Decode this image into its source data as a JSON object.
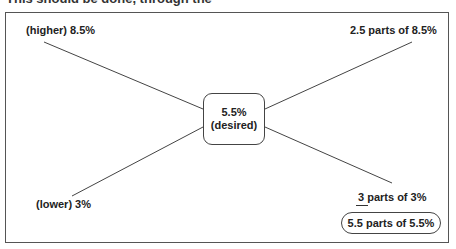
{
  "header_cut_text": "This should be done, through the",
  "diagram": {
    "top_left": "(higher) 8.5%",
    "top_right": "2.5 parts of 8.5%",
    "center_line1": "5.5%",
    "center_line2": "(desired)",
    "bottom_left": "(lower) 3%",
    "bottom_right": "3 parts of 3%",
    "result": "5.5 parts of 5.5%"
  }
}
